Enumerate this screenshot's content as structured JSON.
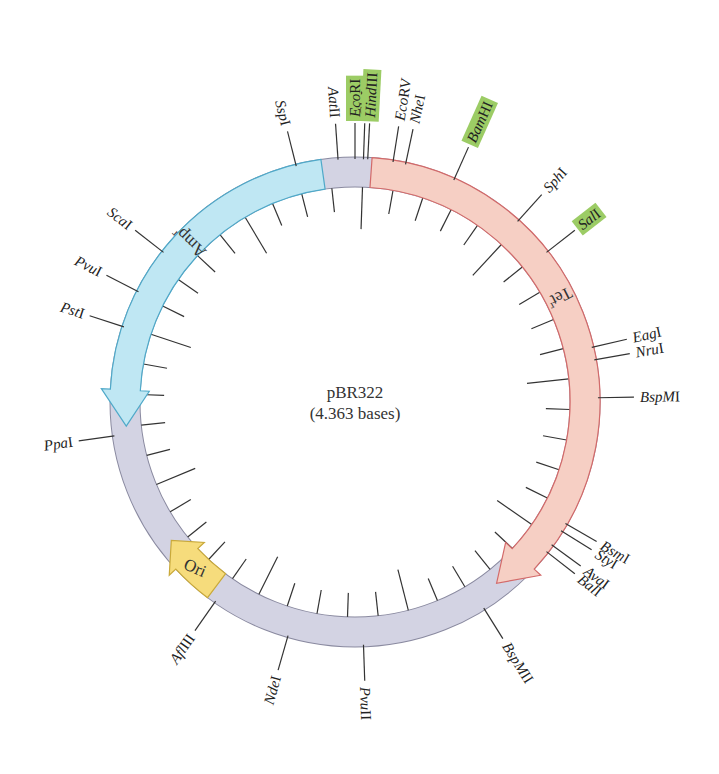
{
  "plasmid": {
    "name": "pBR322",
    "size_label": "(4.363 bases)",
    "colors": {
      "backbone": "#d3d3e3",
      "backbone_stroke": "#8a8aa0",
      "amp": "#bfe7f3",
      "amp_stroke": "#4fa9c9",
      "tet": "#f6cfc4",
      "tet_stroke": "#d36a6a",
      "ori": "#f6dc7c",
      "ori_stroke": "#c9a93a",
      "highlight": "#9ccc65"
    }
  },
  "genes": [
    {
      "id": "amp",
      "label": "Amp",
      "superscript": "r",
      "start_deg": -8,
      "end_deg": -96,
      "direction": "ccw"
    },
    {
      "id": "tet",
      "label": "Tet",
      "superscript": "r",
      "start_deg": 4,
      "end_deg": 142,
      "direction": "cw"
    },
    {
      "id": "ori",
      "label": "Ori",
      "start_deg": 217,
      "end_deg": 233,
      "direction": "cw"
    }
  ],
  "sites": [
    {
      "label": "SspI",
      "deg": -14,
      "highlight": false,
      "italic": "Ssp"
    },
    {
      "label": "AatII",
      "deg": -4,
      "highlight": false,
      "italic": "Aat"
    },
    {
      "label": "EcoRI",
      "deg": 0,
      "highlight": true,
      "italic": "Eco"
    },
    {
      "label": "ClaI",
      "deg": 2,
      "highlight": false,
      "italic": "Cla"
    },
    {
      "label": "HindIII",
      "deg": 3,
      "highlight": true,
      "italic": "Hind"
    },
    {
      "label": "EcoRV",
      "deg": 9,
      "highlight": false,
      "italic": "Eco"
    },
    {
      "label": "NheI",
      "deg": 12,
      "highlight": false,
      "italic": "Nhe"
    },
    {
      "label": "BamHI",
      "deg": 24,
      "highlight": true,
      "italic": "Bam"
    },
    {
      "label": "SphI",
      "deg": 42,
      "highlight": false,
      "italic": "Sph"
    },
    {
      "label": "SalI",
      "deg": 52,
      "highlight": true,
      "italic": "Sal"
    },
    {
      "label": "EagI",
      "deg": 77,
      "highlight": false,
      "italic": "Eag"
    },
    {
      "label": "NruI",
      "deg": 80,
      "highlight": false,
      "italic": "Nru"
    },
    {
      "label": "BspMI",
      "deg": 89,
      "highlight": false,
      "italic": "BspM"
    },
    {
      "label": "BsmI",
      "deg": 120,
      "highlight": false,
      "italic": "Bsm"
    },
    {
      "label": "StyI",
      "deg": 122,
      "highlight": false,
      "italic": "Sty"
    },
    {
      "label": "AvaI",
      "deg": 126,
      "highlight": false,
      "italic": "Ava"
    },
    {
      "label": "BalI",
      "deg": 128,
      "highlight": false,
      "italic": "Bal"
    },
    {
      "label": "BspMII",
      "deg": 148,
      "highlight": false,
      "italic": "BspM"
    },
    {
      "label": "PvuII",
      "deg": 178,
      "highlight": false,
      "italic": "Pvu"
    },
    {
      "label": "NdeI",
      "deg": 196,
      "highlight": false,
      "italic": "Nde"
    },
    {
      "label": "AflIII",
      "deg": 215,
      "highlight": false,
      "italic": "Afl"
    },
    {
      "label": "PpaI",
      "deg": -98,
      "highlight": false,
      "italic": "Ppa"
    },
    {
      "label": "PstI",
      "deg": -72,
      "highlight": false,
      "italic": "Pst"
    },
    {
      "label": "PvuI",
      "deg": -63,
      "highlight": false,
      "italic": "Pvu"
    },
    {
      "label": "ScaI",
      "deg": -52,
      "highlight": false,
      "italic": "Sca"
    }
  ],
  "inner_ticks": {
    "count": 44,
    "long_every": 5
  }
}
